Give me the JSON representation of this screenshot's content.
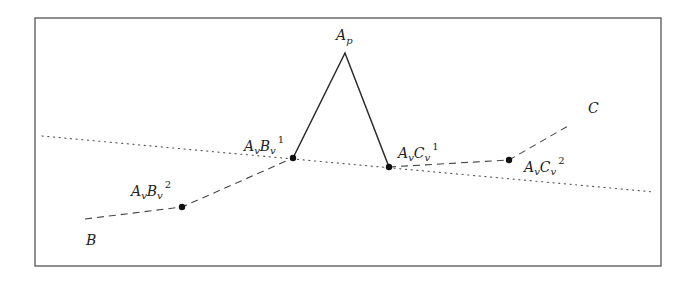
{
  "figure": {
    "frame": {
      "x1": 35,
      "y1": 18,
      "x2": 661,
      "y2": 266,
      "color": "#555555"
    },
    "colors": {
      "line": "#2a2a2a",
      "dashed": "#444444",
      "dotted": "#555555",
      "point": "#111111"
    },
    "dotted_line": {
      "x1": 42,
      "y1": 136,
      "x2": 654,
      "y2": 192
    },
    "solid_polyline": [
      [
        293,
        158
      ],
      [
        345,
        53
      ],
      [
        389,
        167
      ]
    ],
    "dashed_left": [
      [
        85,
        219
      ],
      [
        182,
        207
      ],
      [
        293,
        158
      ]
    ],
    "dashed_right": [
      [
        389,
        167
      ],
      [
        509,
        160
      ],
      [
        568,
        126
      ]
    ],
    "points": [
      {
        "id": "AvBv1",
        "x": 293,
        "y": 158
      },
      {
        "id": "AvCv1",
        "x": 389,
        "y": 167
      },
      {
        "id": "AvBv2",
        "x": 182,
        "y": 207
      },
      {
        "id": "AvCv2",
        "x": 509,
        "y": 160
      }
    ],
    "labels": {
      "Ap": {
        "main": "A",
        "sub": "p",
        "sup": ""
      },
      "AvBv1": {
        "main1": "A",
        "sub1": "v",
        "main2": "B",
        "sub2": "v",
        "sup": "1"
      },
      "AvCv1": {
        "main1": "A",
        "sub1": "v",
        "main2": "C",
        "sub2": "v",
        "sup": "1"
      },
      "AvBv2": {
        "main1": "A",
        "sub1": "v",
        "main2": "B",
        "sub2": "v",
        "sup": "2"
      },
      "AvCv2": {
        "main1": "A",
        "sub1": "v",
        "main2": "C",
        "sub2": "v",
        "sup": "2"
      },
      "B": "B",
      "C": "C"
    }
  }
}
